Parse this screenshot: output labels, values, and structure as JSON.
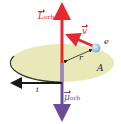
{
  "diagram": {
    "colors": {
      "L_orb": "#e8272e",
      "mu_orb": "#6a4c9c",
      "velocity": "#e8272e",
      "current": "#1a1a1a",
      "orbit_fill": "#e9e8b8",
      "orbit_edge": "#3a3a2a",
      "electron": "#9fc9e6"
    },
    "labels": {
      "L": {
        "main": "L",
        "sub": "orb"
      },
      "mu": {
        "main": "μ",
        "sub": "orb"
      },
      "v": "v",
      "e": "e",
      "r": "r",
      "A": "A",
      "i": "i"
    }
  }
}
